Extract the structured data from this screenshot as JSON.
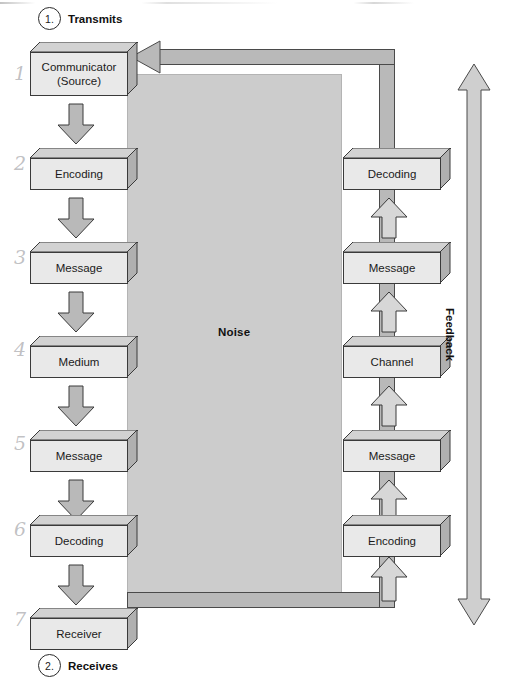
{
  "diagram": {
    "noise_label": "Noise",
    "feedback_label": "Feedback",
    "colors": {
      "noise_panel": "#cccccc",
      "box_fill": "#e9e9e9",
      "box_top": "#d2d2d2",
      "box_side": "#b0b0b0",
      "arrow_fill": "#b9b9b9",
      "outline": "#3a3a3a",
      "page_bg": "#ffffff"
    }
  },
  "callouts": [
    {
      "number": "1.",
      "label": "Transmits"
    },
    {
      "number": "2.",
      "label": "Receives"
    }
  ],
  "left_column": {
    "name": "sender-chain",
    "direction": "downward",
    "boxes": [
      {
        "label": "Communicator\n(Source)",
        "line1": "Communicator",
        "line2": "(Source)"
      },
      {
        "label": "Encoding",
        "line1": "Encoding",
        "line2": ""
      },
      {
        "label": "Message",
        "line1": "Message",
        "line2": ""
      },
      {
        "label": "Medium",
        "line1": "Medium",
        "line2": ""
      },
      {
        "label": "Message",
        "line1": "Message",
        "line2": ""
      },
      {
        "label": "Decoding",
        "line1": "Decoding",
        "line2": ""
      },
      {
        "label": "Receiver",
        "line1": "Receiver",
        "line2": ""
      }
    ]
  },
  "right_column": {
    "name": "feedback-chain",
    "direction": "upward",
    "boxes": [
      {
        "label": "Decoding"
      },
      {
        "label": "Message"
      },
      {
        "label": "Channel"
      },
      {
        "label": "Message"
      },
      {
        "label": "Encoding"
      }
    ]
  },
  "margin_marks": [
    "1",
    "2",
    "3",
    "4",
    "5",
    "6",
    "7"
  ]
}
